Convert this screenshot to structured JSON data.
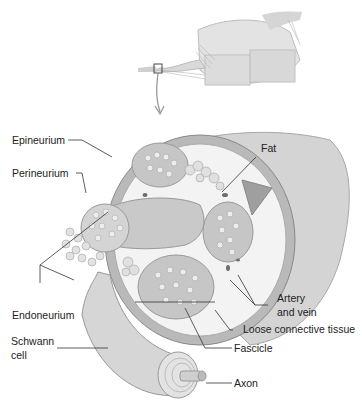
{
  "diagram": {
    "labels": {
      "fat": "Fat",
      "epineurium": "Epineurium",
      "perineurium": "Perineurium",
      "endoneurium": "Endoneurium",
      "schwann_line1": "Schwann",
      "schwann_line2": "cell",
      "artery_line1": "Artery",
      "artery_line2": "and vein",
      "loose_connective_tissue": "Loose connective tissue",
      "fascicle": "Fascicle",
      "axon": "Axon"
    },
    "colors": {
      "tissue_light": "#e6e6e6",
      "tissue_mid": "#c9c9c9",
      "tissue_dark": "#9a9a9a",
      "leader_line": "#333333",
      "background": "#ffffff"
    }
  }
}
